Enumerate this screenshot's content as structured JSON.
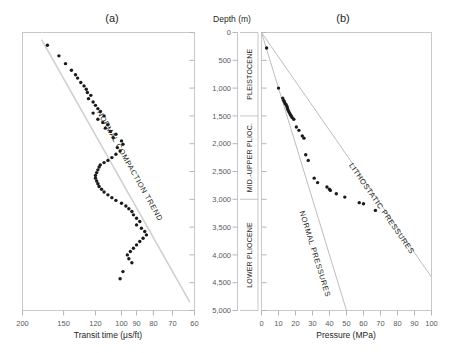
{
  "figure": {
    "panel_a_label": "(a)",
    "panel_b_label": "(b)",
    "depth_axis_title": "Depth (m)"
  },
  "chart_data": [
    {
      "type": "scatter",
      "panel": "(a)",
      "title": "(a)",
      "xlabel": "Transit time (μs/ft)",
      "ylabel": "Depth (m)",
      "xticks": [
        200,
        150,
        120,
        100,
        90,
        80,
        70,
        60
      ],
      "xtick_labels": [
        "200",
        "150",
        "120",
        "100",
        "90",
        "80",
        "70",
        "60"
      ],
      "x_scale": "log-reversed",
      "xlim": [
        200,
        60
      ],
      "yticks": [
        0,
        500,
        1000,
        1500,
        2000,
        2500,
        3000,
        3500,
        4000,
        4500,
        5000
      ],
      "ytick_labels": [
        "0",
        "500",
        "1,000",
        "1,500",
        "2,000",
        "2,500",
        "3,000",
        "3,500",
        "4,000",
        "4,500",
        "5,000"
      ],
      "ylim": [
        0,
        5000
      ],
      "y_inverted": true,
      "grid": false,
      "legend": "none",
      "annotations": [
        {
          "text": "NORMAL COMPACTION TREND",
          "rotation": 52
        }
      ],
      "trendline": {
        "name": "NORMAL COMPACTION TREND",
        "points": [
          [
            175,
            130
          ],
          [
            62,
            4850
          ]
        ]
      },
      "series": [
        {
          "name": "Transit time",
          "x": [
            168,
            155,
            148,
            142,
            138,
            136,
            133,
            130,
            128,
            127,
            124,
            126,
            122,
            120,
            118,
            116,
            122,
            113,
            118,
            114,
            110,
            112,
            108,
            104,
            106,
            100,
            99,
            103,
            101,
            104,
            107,
            110,
            113,
            116,
            117,
            118,
            119,
            120,
            120,
            119,
            118,
            117,
            115,
            113,
            110,
            107,
            104,
            100,
            97,
            95,
            93,
            92,
            90,
            88,
            90,
            87,
            85,
            84,
            86,
            88,
            90,
            92,
            94,
            96,
            95,
            93,
            99,
            101
          ],
          "y": [
            230,
            420,
            560,
            680,
            760,
            820,
            900,
            960,
            1020,
            1080,
            1130,
            1190,
            1250,
            1310,
            1370,
            1420,
            1450,
            1500,
            1560,
            1620,
            1660,
            1720,
            1780,
            1830,
            1890,
            1950,
            2010,
            2070,
            2130,
            2190,
            2250,
            2300,
            2340,
            2380,
            2420,
            2470,
            2520,
            2570,
            2620,
            2670,
            2720,
            2770,
            2820,
            2870,
            2920,
            2970,
            3020,
            3070,
            3120,
            3170,
            3220,
            3280,
            3340,
            3400,
            3460,
            3520,
            3580,
            3640,
            3700,
            3760,
            3820,
            3880,
            3940,
            4000,
            4070,
            4140,
            4300,
            4430
          ]
        }
      ]
    },
    {
      "type": "scatter",
      "panel": "(b)",
      "title": "(b)",
      "xlabel": "Pressure (MPa)",
      "ylabel": "Depth (m)",
      "xticks": [
        0,
        10,
        20,
        30,
        40,
        50,
        60,
        70,
        80,
        90,
        100
      ],
      "xtick_labels": [
        "0",
        "10",
        "20",
        "30",
        "40",
        "50",
        "60",
        "70",
        "80",
        "90",
        "100"
      ],
      "xlim": [
        0,
        100
      ],
      "yticks": [
        0,
        500,
        1000,
        1500,
        2000,
        2500,
        3000,
        3500,
        4000,
        4500,
        5000
      ],
      "ytick_labels": [
        "0",
        "500",
        "1,000",
        "1,500",
        "2,000",
        "2,500",
        "3,000",
        "3,500",
        "4,000",
        "4,500",
        "5,000"
      ],
      "ylim": [
        0,
        5000
      ],
      "y_inverted": true,
      "grid": false,
      "legend": "none",
      "annotations": [
        {
          "text": "NORMAL PRESSURES",
          "rotation": 72
        },
        {
          "text": "LITHOSTATIC PRESSURES",
          "rotation": 60
        }
      ],
      "reference_lines": [
        {
          "name": "NORMAL PRESSURES",
          "points": [
            [
              0,
              0
            ],
            [
              50,
              5000
            ]
          ],
          "gradient_mpa_per_km": 10
        },
        {
          "name": "LITHOSTATIC PRESSURES",
          "points": [
            [
              0,
              0
            ],
            [
              100,
              4400
            ]
          ],
          "gradient_mpa_per_km": 22.7
        }
      ],
      "series": [
        {
          "name": "Measured pore pressure",
          "x": [
            3,
            10,
            12.5,
            13,
            13.5,
            14,
            14.5,
            15,
            15.2,
            15.5,
            16,
            16.5,
            17,
            17.5,
            18,
            19,
            20.5,
            22,
            24,
            25,
            26,
            27.5,
            31,
            33,
            38.5,
            40,
            40.5,
            44,
            49,
            57.5,
            60,
            67
          ],
          "y": [
            280,
            1000,
            1180,
            1220,
            1250,
            1280,
            1300,
            1330,
            1360,
            1390,
            1420,
            1450,
            1480,
            1500,
            1530,
            1560,
            1700,
            1760,
            1860,
            1900,
            2200,
            2300,
            2620,
            2700,
            2780,
            2820,
            2840,
            2900,
            2960,
            3060,
            3080,
            3200
          ]
        }
      ]
    }
  ],
  "stratigraphy": {
    "units": [
      {
        "label": "PLEISTOCENE",
        "top": 0,
        "base": 1500
      },
      {
        "label": "MID.-UPPER PLIOC.",
        "top": 1500,
        "base": 3000
      },
      {
        "label": "LOWER PLIOCENE",
        "top": 3000,
        "base": 5000
      }
    ]
  },
  "panel_a": {
    "xaxis_title": "Transit time (μs/ft)",
    "trend_label": "NORMAL COMPACTION TREND"
  },
  "panel_b": {
    "xaxis_title": "Pressure (MPa)",
    "normal_label": "NORMAL PRESSURES",
    "lithostatic_label": "LITHOSTATIC PRESSURES"
  }
}
